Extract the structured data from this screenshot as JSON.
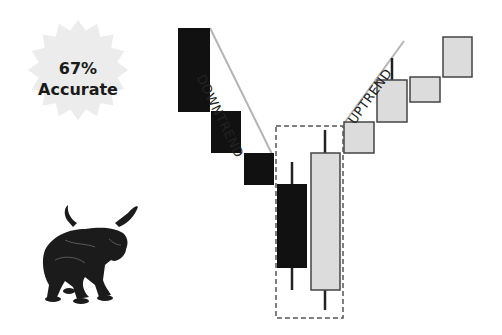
{
  "badge": {
    "percent": "67%",
    "label": "Accurate",
    "fill_color": "#ececec"
  },
  "labels": {
    "downtrend": "DOWNTREND",
    "uptrend": "UPTREND"
  },
  "colors": {
    "bearish": "#111111",
    "bullish": "#dcdcdc",
    "bullish_border": "#444444",
    "trendline": "#b5b5b5",
    "dashed_box": "#555555",
    "wick": "#222222"
  },
  "illustration": {
    "subject": "bull-statue"
  },
  "candles": [
    {
      "type": "bearish",
      "x": 178,
      "y": 28,
      "w": 32,
      "h": 84,
      "wick": null
    },
    {
      "type": "bearish",
      "x": 211,
      "y": 111,
      "w": 30,
      "h": 42,
      "wick": null
    },
    {
      "type": "bearish",
      "x": 244,
      "y": 153,
      "w": 30,
      "h": 32,
      "wick": null
    },
    {
      "type": "bearish",
      "x": 277,
      "y": 184,
      "w": 30,
      "h": 84,
      "wick": {
        "x": 292,
        "top": 162,
        "bottom": 290
      }
    },
    {
      "type": "bullish",
      "x": 311,
      "y": 153,
      "w": 29,
      "h": 137,
      "wick": {
        "x": 325,
        "top": 130,
        "bottom": 310
      }
    },
    {
      "type": "bullish",
      "x": 344,
      "y": 122,
      "w": 30,
      "h": 31,
      "wick": null
    },
    {
      "type": "bullish",
      "x": 377,
      "y": 80,
      "w": 30,
      "h": 42,
      "wick": {
        "x": 392,
        "top": 58,
        "bottom": 80
      }
    },
    {
      "type": "bullish",
      "x": 410,
      "y": 77,
      "w": 30,
      "h": 25,
      "wick": null
    },
    {
      "type": "bullish",
      "x": 443,
      "y": 37,
      "w": 29,
      "h": 40,
      "wick": null
    }
  ],
  "trendlines": {
    "down": {
      "x1": 210,
      "y1": 28,
      "x2": 272,
      "y2": 154
    },
    "up": {
      "x1": 345,
      "y1": 122,
      "x2": 404,
      "y2": 41
    }
  },
  "highlight_box": {
    "x": 276,
    "y": 126,
    "w": 67,
    "h": 192
  },
  "chart_data": {
    "type": "candlestick",
    "title": "",
    "annotations": [
      "DOWNTREND",
      "UPTREND",
      "67% Accurate"
    ],
    "pattern": "Bullish Engulfing (reversal)",
    "series": [
      {
        "name": "bearish",
        "open": [
          100,
          70,
          55,
          43
        ],
        "close": [
          70,
          55,
          43,
          14
        ]
      },
      {
        "name": "bullish",
        "open": [
          8,
          55,
          66,
          75,
          75
        ],
        "close": [
          55,
          66,
          81,
          84,
          98
        ]
      }
    ]
  }
}
